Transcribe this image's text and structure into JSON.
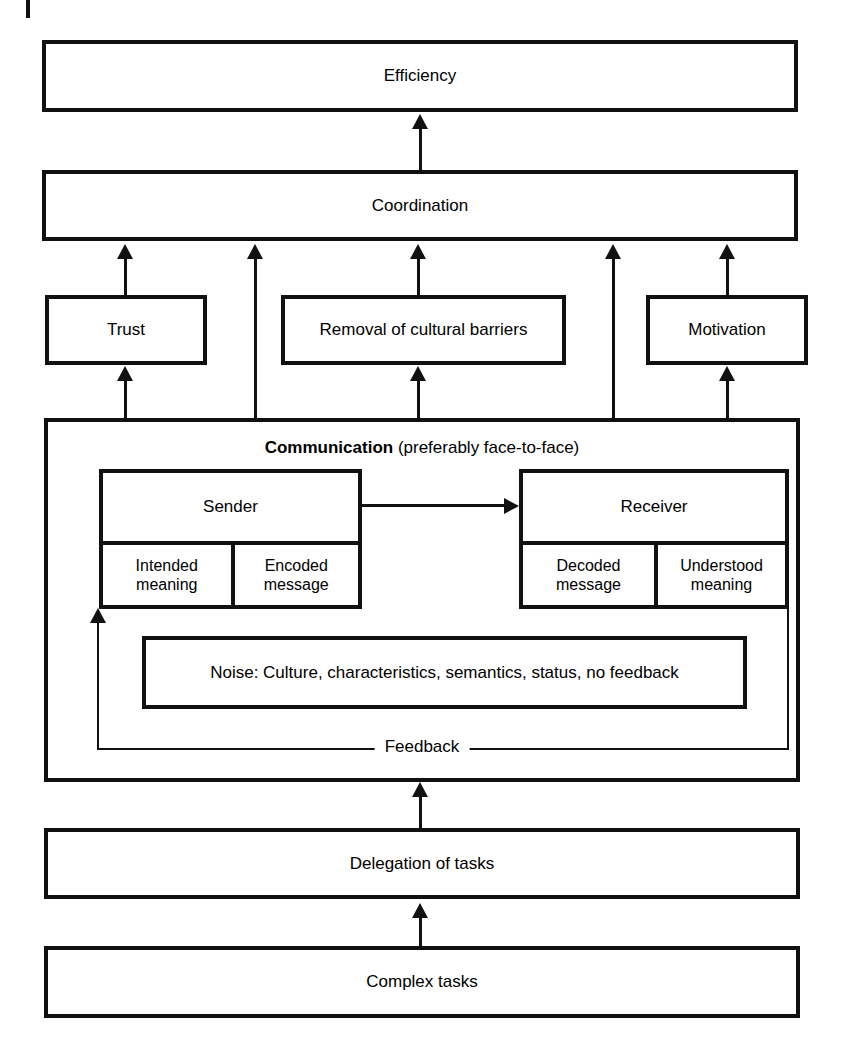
{
  "diagram": {
    "boxes": {
      "efficiency": "Efficiency",
      "coordination": "Coordination",
      "trust": "Trust",
      "removal": "Removal of cultural barriers",
      "motivation": "Motivation",
      "communication_strong": "Communication",
      "communication_rest": " (preferably face-to-face)",
      "sender": "Sender",
      "receiver": "Receiver",
      "intended_meaning": "Intended meaning",
      "encoded_message": "Encoded message",
      "decoded_message": "Decoded message",
      "understood_meaning": "Understood meaning",
      "noise": "Noise: Culture, characteristics, semantics, status, no feedback",
      "feedback": "Feedback",
      "delegation": "Delegation of tasks",
      "complex_tasks": "Complex tasks"
    },
    "colors": {
      "stroke": "#111111",
      "fill": "#ffffff",
      "text": "#000000"
    }
  }
}
